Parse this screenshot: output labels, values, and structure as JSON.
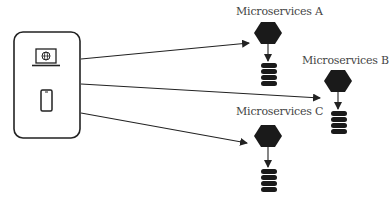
{
  "diagram": {
    "type": "client-to-microservices architecture",
    "client": {
      "devices": [
        {
          "name": "laptop",
          "icon": "laptop-globe-icon"
        },
        {
          "name": "mobile",
          "icon": "smartphone-icon"
        }
      ]
    },
    "services": [
      {
        "label": "Microservices A",
        "icon": "hexagon-icon",
        "database_icon": "database-icon"
      },
      {
        "label": "Microservices B",
        "icon": "hexagon-icon",
        "database_icon": "database-icon"
      },
      {
        "label": "Microservices C",
        "icon": "hexagon-icon",
        "database_icon": "database-icon"
      }
    ],
    "connections": [
      {
        "from": "client",
        "to": "Microservices A"
      },
      {
        "from": "client",
        "to": "Microservices B"
      },
      {
        "from": "client",
        "to": "Microservices C"
      }
    ],
    "colors": {
      "stroke": "#222222",
      "fill": "#1a1a1a",
      "text": "#444444"
    }
  }
}
